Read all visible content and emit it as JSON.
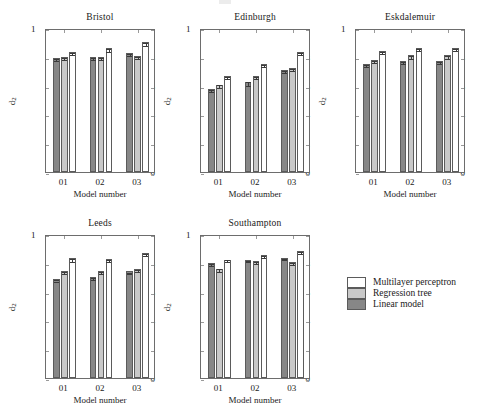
{
  "figure": {
    "width": 477,
    "height": 407,
    "background": "#ffffff"
  },
  "axis": {
    "ylabel": "d",
    "ylabel_sub": "2",
    "xlabel": "Model number",
    "yticks": [
      "0",
      "0.2",
      "0.4",
      "0.6",
      "0.8",
      "1"
    ],
    "ytick_values": [
      0,
      0.2,
      0.4,
      0.6,
      0.8,
      1
    ],
    "xticks": [
      "01",
      "02",
      "03"
    ],
    "ylim": [
      0,
      1
    ]
  },
  "legend": {
    "position": "right-middle",
    "entries": [
      {
        "label": "Multilayer perceptron",
        "series": "mlp",
        "color": "#ffffff"
      },
      {
        "label": "Regression tree",
        "series": "regtree",
        "color": "#c9c9c9"
      },
      {
        "label": "Linear model",
        "series": "linear",
        "color": "#878787"
      }
    ]
  },
  "panels": [
    {
      "title": "Bristol"
    },
    {
      "title": "Edinburgh"
    },
    {
      "title": "Eskdalemuir"
    },
    {
      "title": "Leeds"
    },
    {
      "title": "Southampton"
    }
  ],
  "chart_data": [
    {
      "type": "bar",
      "title": "Bristol",
      "xlabel": "Model number",
      "ylabel": "d2",
      "ylim": [
        0,
        1
      ],
      "grid": false,
      "legend_position": "right-middle",
      "categories": [
        "01",
        "02",
        "03"
      ],
      "series": [
        {
          "name": "Linear model",
          "values": [
            0.79,
            0.8,
            0.828
          ],
          "errors": [
            0.006,
            0.006,
            0.006
          ]
        },
        {
          "name": "Regression tree",
          "values": [
            0.8,
            0.8,
            0.808
          ],
          "errors": [
            0.007,
            0.007,
            0.007
          ]
        },
        {
          "name": "Multilayer perceptron",
          "values": [
            0.832,
            0.858,
            0.9
          ],
          "errors": [
            0.008,
            0.012,
            0.008
          ]
        }
      ]
    },
    {
      "type": "bar",
      "title": "Edinburgh",
      "xlabel": "Model number",
      "ylabel": "d2",
      "ylim": [
        0,
        1
      ],
      "grid": false,
      "legend_position": "right-middle",
      "categories": [
        "01",
        "02",
        "03"
      ],
      "series": [
        {
          "name": "Linear model",
          "values": [
            0.578,
            0.627,
            0.71
          ],
          "errors": [
            0.008,
            0.013,
            0.008
          ]
        },
        {
          "name": "Regression tree",
          "values": [
            0.607,
            0.668,
            0.72
          ],
          "errors": [
            0.008,
            0.008,
            0.008
          ]
        },
        {
          "name": "Multilayer perceptron",
          "values": [
            0.667,
            0.748,
            0.832
          ],
          "errors": [
            0.008,
            0.008,
            0.008
          ]
        }
      ]
    },
    {
      "type": "bar",
      "title": "Eskdalemuir",
      "xlabel": "Model number",
      "ylabel": "d2",
      "ylim": [
        0,
        1
      ],
      "grid": false,
      "legend_position": "right-middle",
      "categories": [
        "01",
        "02",
        "03"
      ],
      "series": [
        {
          "name": "Linear model",
          "values": [
            0.75,
            0.77,
            0.77
          ],
          "errors": [
            0.006,
            0.006,
            0.006
          ]
        },
        {
          "name": "Regression tree",
          "values": [
            0.778,
            0.81,
            0.81
          ],
          "errors": [
            0.007,
            0.008,
            0.008
          ]
        },
        {
          "name": "Multilayer perceptron",
          "values": [
            0.838,
            0.862,
            0.862
          ],
          "errors": [
            0.008,
            0.008,
            0.008
          ]
        }
      ]
    },
    {
      "type": "bar",
      "title": "Leeds",
      "xlabel": "Model number",
      "ylabel": "d2",
      "ylim": [
        0,
        1
      ],
      "grid": false,
      "legend_position": "right-middle",
      "categories": [
        "01",
        "02",
        "03"
      ],
      "series": [
        {
          "name": "Linear model",
          "values": [
            0.69,
            0.702,
            0.74
          ],
          "errors": [
            0.006,
            0.006,
            0.006
          ]
        },
        {
          "name": "Regression tree",
          "values": [
            0.74,
            0.74,
            0.76
          ],
          "errors": [
            0.007,
            0.007,
            0.007
          ]
        },
        {
          "name": "Multilayer perceptron",
          "values": [
            0.83,
            0.828,
            0.868
          ],
          "errors": [
            0.008,
            0.008,
            0.008
          ]
        }
      ]
    },
    {
      "type": "bar",
      "title": "Southampton",
      "xlabel": "Model number",
      "ylabel": "d2",
      "ylim": [
        0,
        1
      ],
      "grid": false,
      "legend_position": "right-middle",
      "categories": [
        "01",
        "02",
        "03"
      ],
      "series": [
        {
          "name": "Linear model",
          "values": [
            0.8,
            0.822,
            0.836
          ],
          "errors": [
            0.006,
            0.006,
            0.006
          ]
        },
        {
          "name": "Regression tree",
          "values": [
            0.76,
            0.815,
            0.805
          ],
          "errors": [
            0.008,
            0.007,
            0.007
          ]
        },
        {
          "name": "Multilayer perceptron",
          "values": [
            0.823,
            0.852,
            0.882
          ],
          "errors": [
            0.007,
            0.008,
            0.008
          ]
        }
      ]
    }
  ],
  "layout": {
    "panel_boxes": [
      {
        "x": 45,
        "y": 29,
        "w": 110,
        "h": 144
      },
      {
        "x": 200,
        "y": 29,
        "w": 110,
        "h": 144
      },
      {
        "x": 355,
        "y": 29,
        "w": 110,
        "h": 144
      },
      {
        "x": 45,
        "y": 235,
        "w": 110,
        "h": 144
      },
      {
        "x": 200,
        "y": 235,
        "w": 110,
        "h": 144
      }
    ],
    "legend_box": {
      "x": 347,
      "y": 277,
      "w": 125,
      "h": 36
    }
  }
}
